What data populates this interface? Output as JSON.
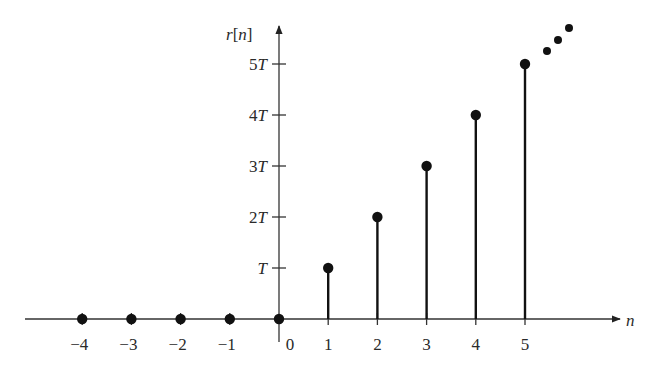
{
  "chart_data": {
    "type": "stem",
    "title": "",
    "xlabel": "n",
    "ylabel": "r[n]",
    "ylabel_parts": {
      "r": "r",
      "open": "[",
      "n": "n",
      "close": "]"
    },
    "x": [
      -4,
      -3,
      -2,
      -1,
      0,
      1,
      2,
      3,
      4,
      5
    ],
    "values": [
      0,
      0,
      0,
      0,
      0,
      1,
      2,
      3,
      4,
      5
    ],
    "value_unit": "T",
    "x_tick_labels": [
      "−4",
      "−3",
      "−2",
      "−1",
      "0",
      "1",
      "2",
      "3",
      "4",
      "5"
    ],
    "y_ticks": [
      1,
      2,
      3,
      4,
      5
    ],
    "y_tick_labels": [
      {
        "coef": "",
        "sym": "T"
      },
      {
        "coef": "2",
        "sym": "T"
      },
      {
        "coef": "3",
        "sym": "T"
      },
      {
        "coef": "4",
        "sym": "T"
      },
      {
        "coef": "5",
        "sym": "T"
      }
    ],
    "continuation": "ellipsis dots indicating sequence continues increasing",
    "xlim": [
      -5,
      6.8
    ],
    "ylim": [
      -0.5,
      5.8
    ],
    "grid": false,
    "legend": null
  },
  "colors": {
    "stem": "#111111",
    "axis": "#333333",
    "text": "#2a2a2a",
    "background": "#ffffff"
  }
}
